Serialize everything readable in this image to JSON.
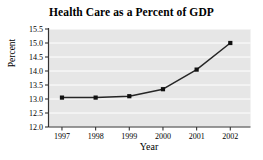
{
  "chart_data": {
    "type": "line",
    "title": "Health Care as a Percent of GDP",
    "xlabel": "Year",
    "ylabel": "Percent",
    "categories": [
      "1997",
      "1998",
      "1999",
      "2000",
      "2001",
      "2002"
    ],
    "x": [
      1997,
      1998,
      1999,
      2000,
      2001,
      2002
    ],
    "values": [
      13.05,
      13.05,
      13.1,
      13.35,
      14.05,
      15.0
    ],
    "series": [
      {
        "name": "Health Care Percent of GDP",
        "values": [
          13.05,
          13.05,
          13.1,
          13.35,
          14.05,
          15.0
        ]
      }
    ],
    "ylim": [
      12.0,
      15.5
    ],
    "xlim": [
      1996.6,
      2002.6
    ],
    "yticks": [
      "12.0",
      "12.5",
      "13.0",
      "13.5",
      "14.0",
      "14.5",
      "15.0",
      "15.5"
    ],
    "ytick_values": [
      12.0,
      12.5,
      13.0,
      13.5,
      14.0,
      14.5,
      15.0,
      15.5
    ],
    "xticks": [
      "1997",
      "1998",
      "1999",
      "2000",
      "2001",
      "2002"
    ],
    "grid": "horizontal",
    "legend": "none",
    "marker": "square",
    "colors": {
      "line": "#262626",
      "marker": "#111111",
      "plot_background": "#e6e6e6",
      "gridline": "#ffffff",
      "axis": "#333333",
      "page_background": "#ffffff",
      "text": "#000000"
    }
  }
}
